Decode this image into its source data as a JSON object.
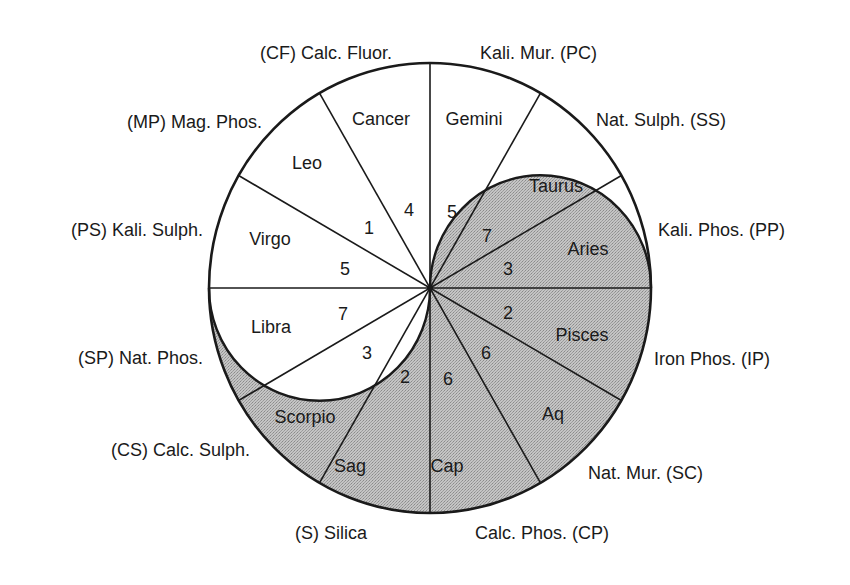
{
  "diagram": {
    "shade_color": "#b9b9b9",
    "line_color": "#1a1a1a",
    "segments": [
      {
        "sign": "Aries",
        "number": "3",
        "salt": "Kali. Phos. (PP)",
        "shaded": true
      },
      {
        "sign": "Taurus",
        "number": "7",
        "salt": "Nat. Sulph. (SS)",
        "shaded": "partial"
      },
      {
        "sign": "Gemini",
        "number": "5",
        "salt": "Kali. Mur. (PC)",
        "shaded": "partial"
      },
      {
        "sign": "Cancer",
        "number": "4",
        "salt": "(CF) Calc. Fluor.",
        "shaded": false
      },
      {
        "sign": "Leo",
        "number": "1",
        "salt": "(MP) Mag. Phos.",
        "shaded": false
      },
      {
        "sign": "Virgo",
        "number": "5",
        "salt": "(PS) Kali. Sulph.",
        "shaded": false
      },
      {
        "sign": "Libra",
        "number": "7",
        "salt": "(SP) Nat. Phos.",
        "shaded": "partial"
      },
      {
        "sign": "Scorpio",
        "number": "3",
        "salt": "(CS) Calc. Sulph.",
        "shaded": "partial"
      },
      {
        "sign": "Sag",
        "number": "2",
        "salt": "(S) Silica",
        "shaded": true
      },
      {
        "sign": "Cap",
        "number": "6",
        "salt": "Calc. Phos. (CP)",
        "shaded": true
      },
      {
        "sign": "Aq",
        "number": "6",
        "salt": "Nat. Mur. (SC)",
        "shaded": true
      },
      {
        "sign": "Pisces",
        "number": "2",
        "salt": "Iron Phos. (IP)",
        "shaded": true
      }
    ]
  }
}
